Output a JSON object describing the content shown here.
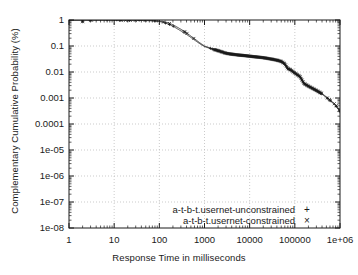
{
  "chart_data": {
    "type": "line",
    "title": "",
    "xlabel": "Response Time in milliseconds",
    "ylabel": "Complementary Cumulative Probability (%)",
    "xscale": "log",
    "yscale": "log",
    "xlim": [
      1,
      1000000
    ],
    "ylim": [
      1e-08,
      1
    ],
    "grid": true,
    "legend_position": "bottom-center",
    "xticks": [
      "1",
      "10",
      "100",
      "1000",
      "10000",
      "100000",
      "1e+06"
    ],
    "xtick_values": [
      1,
      10,
      100,
      1000,
      10000,
      100000,
      1000000
    ],
    "yticks": [
      "1",
      "0.1",
      "0.01",
      "0.001",
      "0.0001",
      "1e-05",
      "1e-06",
      "1e-07",
      "1e-08"
    ],
    "ytick_values": [
      1,
      0.1,
      0.01,
      0.001,
      0.0001,
      1e-05,
      1e-06,
      1e-07,
      1e-08
    ],
    "series": [
      {
        "name": "a-t-b-t.usernet-unconstrained",
        "marker": "+",
        "color": "#1a1a1a",
        "x": [
          1,
          2,
          5,
          10,
          20,
          40,
          70,
          100,
          150,
          200,
          300,
          400,
          600,
          800,
          1000,
          1500,
          2000,
          3000,
          4000,
          6000,
          8000,
          10000,
          15000,
          20000,
          30000,
          40000,
          50000,
          60000,
          70000,
          80000,
          100000,
          130000,
          160000,
          200000,
          300000,
          400000,
          600000,
          800000,
          1000000,
          1500000,
          2000000,
          2500000,
          3000000
        ],
        "y": [
          1,
          1,
          1,
          1,
          0.99,
          0.97,
          0.93,
          0.88,
          0.72,
          0.58,
          0.38,
          0.28,
          0.17,
          0.12,
          0.095,
          0.075,
          0.065,
          0.052,
          0.048,
          0.044,
          0.042,
          0.04,
          0.037,
          0.035,
          0.031,
          0.028,
          0.025,
          0.02,
          0.013,
          0.012,
          0.009,
          0.0065,
          0.0035,
          0.0028,
          0.0019,
          0.0014,
          0.0008,
          0.0005,
          0.0003,
          0.00012,
          5e-05,
          1.2e-05,
          1.7e-06
        ]
      },
      {
        "name": "a-t-b-t.usernet-constrained",
        "marker": "×",
        "color": "#1a1a1a",
        "x": [
          1,
          2,
          5,
          10,
          20,
          40,
          70,
          100,
          150,
          200,
          300,
          400,
          600,
          800,
          1000,
          1500,
          2000,
          3000,
          4000,
          6000,
          8000,
          10000,
          15000,
          20000,
          30000,
          40000,
          50000,
          60000,
          70000,
          80000,
          100000,
          130000,
          160000,
          200000,
          300000,
          400000,
          600000,
          800000,
          1000000,
          1500000,
          2000000,
          2500000,
          3000000
        ],
        "y": [
          1,
          1,
          1,
          1,
          0.995,
          0.98,
          0.95,
          0.91,
          0.8,
          0.66,
          0.44,
          0.32,
          0.19,
          0.13,
          0.1,
          0.078,
          0.067,
          0.053,
          0.049,
          0.045,
          0.043,
          0.041,
          0.038,
          0.036,
          0.032,
          0.029,
          0.026,
          0.021,
          0.014,
          0.0125,
          0.0092,
          0.0068,
          0.0037,
          0.0029,
          0.002,
          0.0015,
          0.00085,
          0.00055,
          0.00032,
          0.00013,
          5.5e-05,
          1.4e-05,
          2e-06
        ]
      }
    ],
    "legend": [
      {
        "label": "a-t-b-t.usernet-unconstrained",
        "marker": "+"
      },
      {
        "label": "a-t-b-t.usernet-constrained",
        "marker": "×"
      }
    ],
    "colors": {
      "axis": "#1a1a1a",
      "grid": "#b4b4b4",
      "curve": "#1a1a1a",
      "background": "#ffffff"
    }
  }
}
